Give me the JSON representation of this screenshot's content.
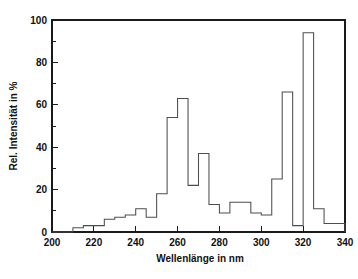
{
  "figure": {
    "background_color": "#ffffff",
    "line_color": "#4d4d4d",
    "axis_color": "#1a1a1a"
  },
  "axes": {
    "x_title": "Wellenlänge in nm",
    "y_title": "Rel. Intensität in %",
    "x_ticks": [
      "200",
      "220",
      "240",
      "260",
      "280",
      "300",
      "320",
      "340"
    ],
    "y_ticks": [
      "0",
      "20",
      "40",
      "60",
      "80",
      "100"
    ]
  },
  "chart_data": {
    "type": "bar",
    "title": "",
    "xlabel": "Wellenlänge in nm",
    "ylabel": "Rel. Intensität in %",
    "xlim": [
      200,
      340
    ],
    "ylim": [
      0,
      100
    ],
    "grid": false,
    "legend": null,
    "bin_width": 5,
    "note": "Stepped histogram (Treppenkurve) of relative spectral intensity versus wavelength; bins are 5 nm wide.",
    "categories": [
      "200-205",
      "205-210",
      "210-215",
      "215-220",
      "220-225",
      "225-230",
      "230-235",
      "235-240",
      "240-245",
      "245-250",
      "250-255",
      "255-260",
      "260-265",
      "265-270",
      "270-275",
      "275-280",
      "280-285",
      "285-290",
      "290-295",
      "295-300",
      "300-305",
      "305-310",
      "310-315",
      "315-320",
      "320-325",
      "325-330",
      "330-335",
      "335-340"
    ],
    "x": [
      200,
      205,
      210,
      215,
      220,
      225,
      230,
      235,
      240,
      245,
      250,
      255,
      260,
      265,
      270,
      275,
      280,
      285,
      290,
      295,
      300,
      305,
      310,
      315,
      320,
      325,
      330,
      335
    ],
    "values": [
      0,
      0,
      2,
      3,
      3,
      6,
      7,
      8,
      11,
      7,
      18,
      54,
      63,
      22,
      37,
      13,
      9,
      14,
      14,
      9,
      8,
      25,
      66,
      3,
      94,
      11,
      4,
      4
    ],
    "series": [
      {
        "name": "Rel. Intensität",
        "values": [
          0,
          0,
          2,
          3,
          3,
          6,
          7,
          8,
          11,
          7,
          18,
          54,
          63,
          22,
          37,
          13,
          9,
          14,
          14,
          9,
          8,
          25,
          66,
          3,
          94,
          11,
          4,
          4
        ]
      }
    ],
    "x_major_ticks": [
      200,
      220,
      240,
      260,
      280,
      300,
      320,
      340
    ],
    "y_major_ticks": [
      0,
      20,
      40,
      60,
      80,
      100
    ],
    "y_minor_ticks": [
      10,
      30,
      50,
      70,
      90
    ],
    "peak_max_value": 94,
    "peak_max_wavelength_range": "310-315"
  }
}
